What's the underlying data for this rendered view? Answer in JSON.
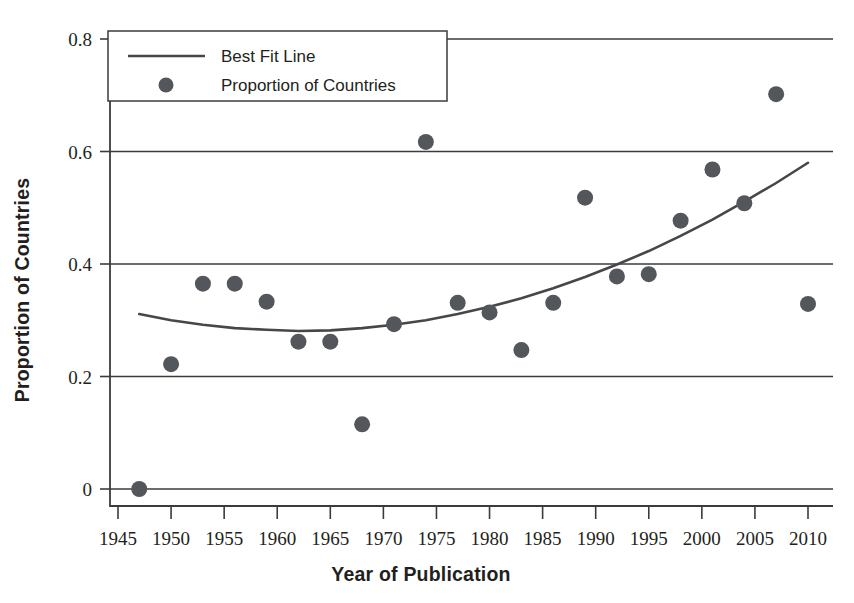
{
  "chart_data": {
    "type": "scatter",
    "title": "",
    "xlabel": "Year of Publication",
    "ylabel": "Proportion of Countries",
    "xlim": [
      1944,
      2011.5
    ],
    "ylim": [
      -0.015,
      0.81
    ],
    "grid": true,
    "legend_position": "top-left",
    "x_ticks": [
      1945,
      1950,
      1955,
      1960,
      1965,
      1970,
      1975,
      1980,
      1985,
      1990,
      1995,
      2000,
      2005,
      2010
    ],
    "x_tick_labels": [
      "1945",
      "1950",
      "1955",
      "1960",
      "1965",
      "1970",
      "1975",
      "1980",
      "1985",
      "1990",
      "1995",
      "2000",
      "2005",
      "2010"
    ],
    "y_ticks": [
      0,
      0.2,
      0.4,
      0.6,
      0.8
    ],
    "y_tick_labels": [
      "0",
      "0.2",
      "0.4",
      "0.6",
      "0.8"
    ],
    "series": [
      {
        "name": "Proportion of Countries",
        "marker": "circle",
        "color": "#53565a",
        "x": [
          1947,
          1950,
          1953,
          1956,
          1959,
          1962,
          1965,
          1968,
          1971,
          1974,
          1977,
          1980,
          1983,
          1986,
          1989,
          1992,
          1995,
          1998,
          2001,
          2004,
          2007,
          2010
        ],
        "y": [
          0.0,
          0.222,
          0.365,
          0.365,
          0.333,
          0.262,
          0.262,
          0.115,
          0.293,
          0.617,
          0.331,
          0.314,
          0.247,
          0.331,
          0.518,
          0.378,
          0.382,
          0.477,
          0.568,
          0.508,
          0.702,
          0.329
        ]
      },
      {
        "name": "Best Fit Line",
        "marker": "line",
        "color": "#45474a",
        "x": [
          1947,
          1950,
          1953,
          1956,
          1959,
          1962,
          1965,
          1968,
          1971,
          1974,
          1977,
          1980,
          1983,
          1986,
          1989,
          1992,
          1995,
          1998,
          2001,
          2004,
          2007,
          2010
        ],
        "y": [
          0.311,
          0.3,
          0.292,
          0.286,
          0.283,
          0.281,
          0.282,
          0.286,
          0.292,
          0.3,
          0.311,
          0.324,
          0.339,
          0.357,
          0.377,
          0.399,
          0.423,
          0.45,
          0.479,
          0.511,
          0.544,
          0.58
        ]
      }
    ]
  },
  "legend": {
    "entries": [
      {
        "label": "Best Fit Line",
        "marker": "line"
      },
      {
        "label": "Proportion of Countries",
        "marker": "circle"
      }
    ]
  },
  "axes": {
    "x_title": "Year of Publication",
    "y_title": "Proportion of Countries"
  }
}
